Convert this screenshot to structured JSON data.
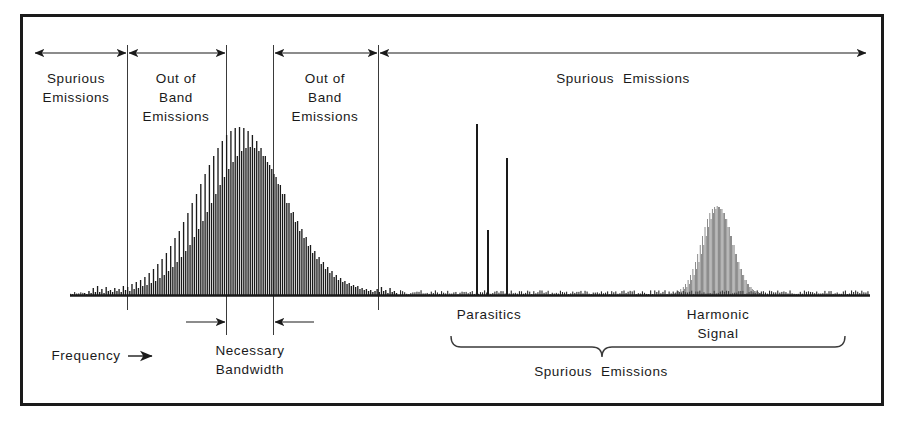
{
  "figure": {
    "title_visible": false,
    "border_color": "#1a1a1a",
    "ink_color": "#1a1a1a",
    "background": "#ffffff"
  },
  "labels": {
    "spurious_left_line1": "Spurious",
    "spurious_left_line2": "Emissions",
    "oob_left_line1": "Out of",
    "oob_left_line2": "Band",
    "oob_left_line3": "Emissions",
    "oob_right_line1": "Out of",
    "oob_right_line2": "Band",
    "oob_right_line3": "Emissions",
    "spurious_top_right": "Spurious  Emissions",
    "necessary_line1": "Necessary",
    "necessary_line2": "Bandwidth",
    "frequency": "Frequency",
    "parasitics": "Parasitics",
    "harmonic_line1": "Harmonic",
    "harmonic_line2": "Signal",
    "spurious_bottom": "Spurious  Emissions"
  },
  "chart_data": {
    "type": "bar",
    "title": "",
    "xlabel": "Frequency",
    "ylabel": "",
    "grid": false,
    "legend": null,
    "axis": {
      "baseline_y_px": 295,
      "x_start_px": 70,
      "x_end_px": 870,
      "y_top_px": 118
    },
    "regions": [
      {
        "name": "Spurious Emissions (left)",
        "x_from_px": 34,
        "x_to_px": 127
      },
      {
        "name": "Out of Band Emissions (left)",
        "x_from_px": 127,
        "x_to_px": 226
      },
      {
        "name": "Necessary Bandwidth",
        "x_from_px": 226,
        "x_to_px": 273
      },
      {
        "name": "Out of Band Emissions (right)",
        "x_from_px": 273,
        "x_to_px": 378
      },
      {
        "name": "Spurious Emissions (right)",
        "x_from_px": 378,
        "x_to_px": 868
      }
    ],
    "divider_lines_px": [
      127,
      226,
      273,
      378
    ],
    "series": [
      {
        "name": "Main signal spectrum",
        "x_from_px": 84,
        "x_to_px": 398,
        "bar_pitch_px": 3.45,
        "values": [
          2,
          1,
          4,
          2,
          7,
          3,
          9,
          3,
          6,
          2,
          8,
          4,
          5,
          3,
          7,
          4,
          6,
          3,
          9,
          5,
          8,
          4,
          11,
          6,
          13,
          7,
          15,
          9,
          18,
          10,
          22,
          12,
          26,
          14,
          31,
          17,
          36,
          20,
          42,
          24,
          49,
          28,
          57,
          33,
          64,
          38,
          73,
          44,
          82,
          50,
          92,
          58,
          101,
          66,
          111,
          74,
          121,
          83,
          130,
          92,
          139,
          101,
          147,
          110,
          154,
          118,
          160,
          126,
          164,
          133,
          167,
          139,
          168,
          144,
          167,
          147,
          164,
          148,
          160,
          147,
          154,
          144,
          147,
          139,
          139,
          133,
          130,
          126,
          121,
          118,
          111,
          110,
          101,
          101,
          92,
          92,
          82,
          83,
          73,
          74,
          64,
          66,
          57,
          58,
          49,
          50,
          42,
          44,
          36,
          38,
          31,
          33,
          26,
          28,
          22,
          24,
          18,
          20,
          15,
          17,
          13,
          14,
          11,
          12,
          9,
          10,
          8,
          9,
          6,
          7,
          5,
          6,
          4,
          5,
          3,
          4,
          6,
          3,
          8,
          4,
          5,
          2,
          7,
          3,
          4,
          2
        ]
      },
      {
        "name": "Parasitics",
        "type": "spikes",
        "spikes_px": [
          {
            "x": 476,
            "height": 171
          },
          {
            "x": 487,
            "height": 65
          },
          {
            "x": 506,
            "height": 137
          }
        ]
      },
      {
        "name": "Harmonic Signal",
        "x_from_px": 672,
        "x_to_px": 764,
        "bar_pitch_px": 2.0,
        "values": [
          1,
          2,
          1,
          3,
          2,
          4,
          3,
          6,
          4,
          8,
          6,
          11,
          8,
          15,
          11,
          20,
          15,
          26,
          20,
          33,
          26,
          41,
          33,
          50,
          41,
          59,
          50,
          68,
          59,
          76,
          68,
          82,
          76,
          86,
          82,
          88,
          86,
          89,
          88,
          88,
          86,
          86,
          82,
          82,
          76,
          76,
          68,
          68,
          59,
          59,
          50,
          50,
          41,
          41,
          33,
          33,
          26,
          26,
          20,
          20,
          15,
          15,
          11,
          11,
          8,
          8,
          6,
          5,
          4,
          4,
          3,
          3,
          2,
          2,
          1,
          1
        ]
      },
      {
        "name": "Noise floor",
        "type": "dense-noise",
        "x_from_px": 400,
        "x_to_px": 868,
        "max_height_px": 4
      }
    ]
  }
}
